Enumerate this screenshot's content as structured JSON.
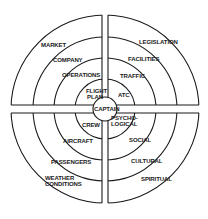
{
  "diagram": {
    "center_label": "CAPTAIN",
    "quadrants": {
      "upper_left": [
        {
          "label": "FLIGHT",
          "x": 86,
          "y": 93
        },
        {
          "label": "PLAN",
          "x": 87,
          "y": 99
        },
        {
          "label": "OPERATIONS",
          "x": 62,
          "y": 76
        },
        {
          "label": "COMPANY",
          "x": 53,
          "y": 60
        },
        {
          "label": "MARKET",
          "x": 41,
          "y": 45
        }
      ],
      "upper_right": [
        {
          "label": "ATC",
          "x": 118,
          "y": 98
        },
        {
          "label": "TRAFFIC",
          "x": 120,
          "y": 78
        },
        {
          "label": "FACILITIES",
          "x": 128,
          "y": 60
        },
        {
          "label": "LEGISLATION",
          "x": 138,
          "y": 44
        }
      ],
      "lower_left": [
        {
          "label": "CREW",
          "x": 81,
          "y": 125
        },
        {
          "label": "AIRCRAFT",
          "x": 62,
          "y": 142
        },
        {
          "label": "PASSENGERS",
          "x": 50,
          "y": 163
        },
        {
          "label": "WEATHER",
          "x": 45,
          "y": 180
        },
        {
          "label": "CONDITIONS",
          "x": 45,
          "y": 186
        }
      ],
      "lower_right": [
        {
          "label": "PSYCHO-",
          "x": 111,
          "y": 119
        },
        {
          "label": "LOGICAL",
          "x": 111,
          "y": 125
        },
        {
          "label": "SOCIAL",
          "x": 128,
          "y": 142
        },
        {
          "label": "CULTURAL",
          "x": 132,
          "y": 163
        },
        {
          "label": "SPIRITUAL",
          "x": 140,
          "y": 181
        }
      ]
    },
    "colors": {
      "line": "#1a1a1a",
      "background": "#ffffff"
    }
  }
}
